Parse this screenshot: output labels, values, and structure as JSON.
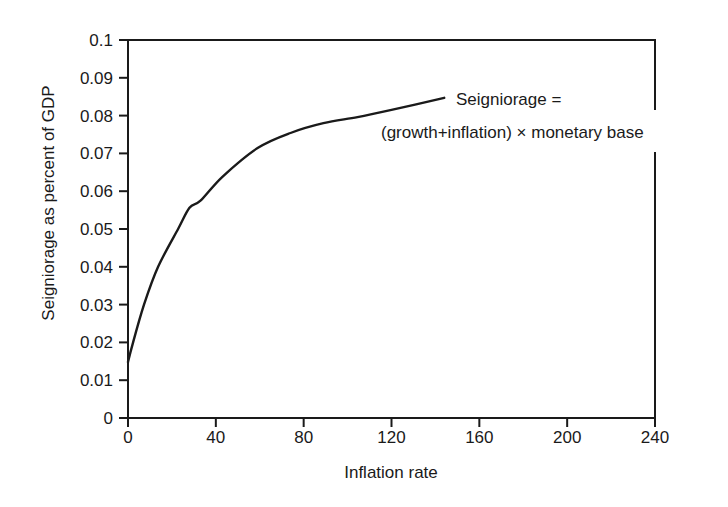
{
  "chart_data": {
    "type": "line",
    "title": "",
    "xlabel": "Inflation rate",
    "ylabel": "Seigniorage as percent of GDP",
    "xlim": [
      0,
      240
    ],
    "ylim": [
      0,
      0.1
    ],
    "xticks": [
      0,
      40,
      80,
      120,
      160,
      200,
      240
    ],
    "yticks": [
      0,
      0.01,
      0.02,
      0.03,
      0.04,
      0.05,
      0.06,
      0.07,
      0.08,
      0.09,
      0.1
    ],
    "ytick_labels": [
      "0",
      "0.01",
      "0.02",
      "0.03",
      "0.04",
      "0.05",
      "0.06",
      "0.07",
      "0.08",
      "0.09",
      "0.1"
    ],
    "grid": false,
    "legend": null,
    "series": [
      {
        "name": "Seigniorage",
        "x": [
          0,
          2.3,
          7.3,
          13.7,
          22.8,
          28,
          33,
          43,
          59,
          74,
          89,
          104.5,
          120,
          144
        ],
        "y": [
          0.0148,
          0.02,
          0.03,
          0.04,
          0.05,
          0.0556,
          0.0575,
          0.0638,
          0.0714,
          0.0754,
          0.078,
          0.0796,
          0.0815,
          0.0847
        ]
      }
    ],
    "annotations": [
      {
        "text": "Seigniorage =",
        "line": 1
      },
      {
        "text": "(growth+inflation) × monetary base",
        "line": 2
      }
    ]
  },
  "colors": {
    "background": "#ffffff",
    "ink": "#1a1a1a"
  }
}
